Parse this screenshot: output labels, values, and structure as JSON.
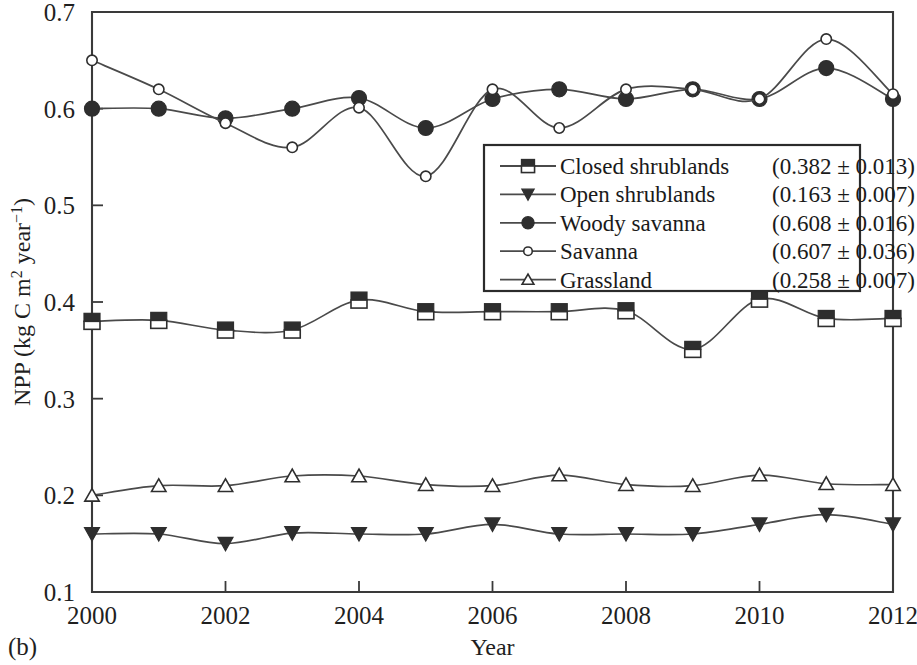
{
  "figure": {
    "panel_label": "(b)"
  },
  "chart_data": {
    "type": "line",
    "title": "",
    "xlabel": "Year",
    "ylabel": "NPP (kg C m² year⁻¹)",
    "ylabel_parts": {
      "prefix": "NPP (kg C m",
      "sup1": "2",
      "mid": " year",
      "sup2": "−1",
      "suffix": ")"
    },
    "x": [
      2000,
      2001,
      2002,
      2003,
      2004,
      2005,
      2006,
      2007,
      2008,
      2009,
      2010,
      2011,
      2012
    ],
    "xlim": [
      2000,
      2012
    ],
    "ylim": [
      0.1,
      0.7
    ],
    "xticks": [
      2000,
      2002,
      2004,
      2006,
      2008,
      2010,
      2012
    ],
    "xtick_labels": [
      "2000",
      "2002",
      "2004",
      "2006",
      "2008",
      "2010",
      "2012"
    ],
    "yticks": [
      0.1,
      0.2,
      0.3,
      0.4,
      0.5,
      0.6,
      0.7
    ],
    "ytick_labels": [
      "0.1",
      "0.2",
      "0.3",
      "0.4",
      "0.5",
      "0.6",
      "0.7"
    ],
    "grid": false,
    "legend_position": "center-right",
    "series": [
      {
        "name": "Closed shrublands",
        "stat": "(0.382 ± 0.013)",
        "mean": 0.382,
        "sd": 0.013,
        "marker": "square-half",
        "values": [
          0.38,
          0.381,
          0.371,
          0.371,
          0.402,
          0.39,
          0.39,
          0.39,
          0.391,
          0.351,
          0.403,
          0.383,
          0.383
        ]
      },
      {
        "name": "Open shrublands",
        "stat": "(0.163 ± 0.007)",
        "mean": 0.163,
        "sd": 0.007,
        "marker": "triangle-down-filled",
        "values": [
          0.16,
          0.16,
          0.15,
          0.161,
          0.16,
          0.16,
          0.17,
          0.16,
          0.16,
          0.16,
          0.17,
          0.18,
          0.17
        ]
      },
      {
        "name": "Woody savanna",
        "stat": "(0.608 ± 0.016)",
        "mean": 0.608,
        "sd": 0.016,
        "marker": "circle-filled",
        "values": [
          0.6,
          0.6,
          0.59,
          0.6,
          0.611,
          0.58,
          0.61,
          0.62,
          0.61,
          0.62,
          0.61,
          0.642,
          0.61
        ]
      },
      {
        "name": "Savanna",
        "stat": "(0.607 ± 0.036)",
        "mean": 0.607,
        "sd": 0.036,
        "marker": "circle-open",
        "values": [
          0.65,
          0.62,
          0.585,
          0.56,
          0.601,
          0.53,
          0.62,
          0.58,
          0.62,
          0.62,
          0.61,
          0.672,
          0.615
        ]
      },
      {
        "name": "Grassland",
        "stat": "(0.258 ± 0.007)",
        "mean": 0.258,
        "sd": 0.007,
        "marker": "triangle-up-open",
        "values": [
          0.2,
          0.21,
          0.21,
          0.22,
          0.22,
          0.211,
          0.21,
          0.221,
          0.211,
          0.21,
          0.221,
          0.212,
          0.211
        ]
      }
    ]
  }
}
